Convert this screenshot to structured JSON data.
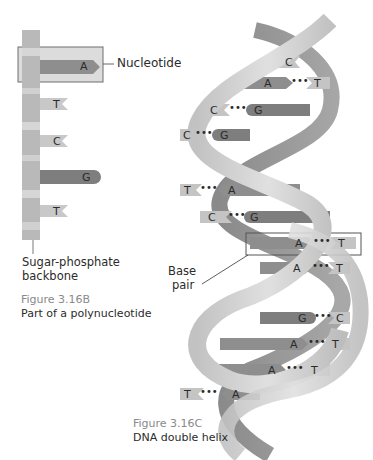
{
  "figure_b": {
    "number": "Figure 3.16B",
    "caption": "Part of a polynucleotide",
    "callouts": {
      "nucleotide": "Nucleotide",
      "backbone_line1": "Sugar-phosphate",
      "backbone_line2": "backbone"
    },
    "bases": [
      "A",
      "T",
      "C",
      "G",
      "T"
    ]
  },
  "figure_c": {
    "number": "Figure 3.16C",
    "caption": "DNA double helix",
    "callouts": {
      "base_pair_line1": "Base",
      "base_pair_line2": "pair"
    },
    "pairs": [
      {
        "left": "",
        "right": "C"
      },
      {
        "left": "A",
        "right": "T"
      },
      {
        "left": "C",
        "right": "G"
      },
      {
        "left": "C",
        "right": "G"
      },
      {
        "left": "T",
        "right": "A"
      },
      {
        "left": "C",
        "right": "G"
      },
      {
        "left": "A",
        "right": "T"
      },
      {
        "left": "A",
        "right": "T"
      },
      {
        "left": "G",
        "right": "C"
      },
      {
        "left": "A",
        "right": "T"
      },
      {
        "left": "A",
        "right": "T"
      },
      {
        "left": "T",
        "right": "A"
      }
    ],
    "hbond": "•••"
  },
  "colors": {
    "backbone": "#b8b8b8",
    "backbone_light": "#d4d4d4",
    "purine_dark": "#8c8c8c",
    "pyrimidine_light": "#c4c4c4",
    "highlight_box": "#d9d9d9",
    "ribbon_front": "#d0d0d0",
    "ribbon_back": "#9a9a9a"
  }
}
